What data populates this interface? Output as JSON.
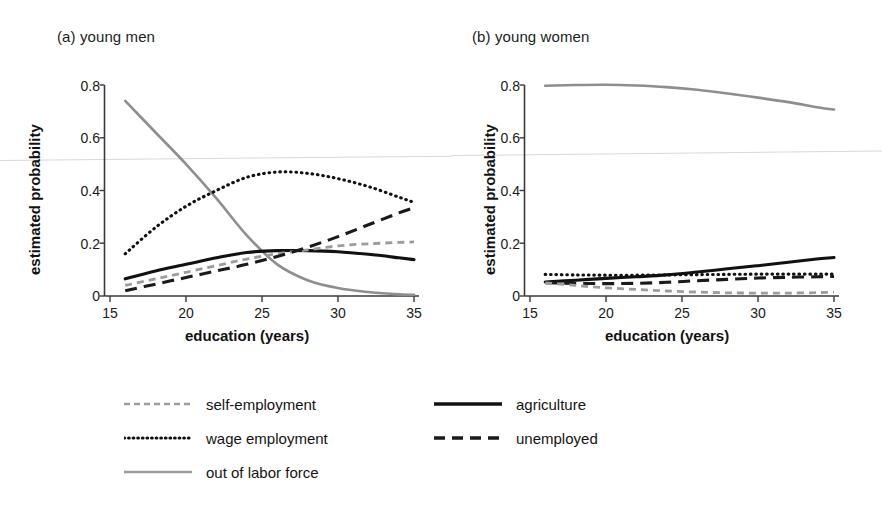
{
  "figure": {
    "background": "#ffffff",
    "panels": [
      {
        "id": "a",
        "title": "(a) young men",
        "xlabel": "education (years)",
        "ylabel": "estimated probability"
      },
      {
        "id": "b",
        "title": "(b) young women",
        "xlabel": "education (years)",
        "ylabel": "estimated probability"
      }
    ]
  },
  "axis": {
    "x_ticks": [
      "15",
      "20",
      "25",
      "30",
      "35"
    ],
    "y_ticks": [
      "0",
      "0.2",
      "0.4",
      "0.6",
      "0.8"
    ]
  },
  "legend": {
    "items": [
      {
        "key": "self",
        "label": "self-employment",
        "style": "gray-short-dash",
        "color": "#9a9a9a"
      },
      {
        "key": "wage",
        "label": "wage employment",
        "style": "black-dotted",
        "color": "#111111"
      },
      {
        "key": "olf",
        "label": "out of labor force",
        "style": "gray-solid",
        "color": "#8e8e8e"
      },
      {
        "key": "agri",
        "label": "agriculture",
        "style": "black-solid",
        "color": "#111111"
      },
      {
        "key": "unemp",
        "label": "unemployed",
        "style": "black-long-dash",
        "color": "#1a1a1a"
      }
    ]
  },
  "chart_data": {
    "type": "line",
    "xlabel": "education (years)",
    "ylabel": "estimated probability",
    "xlim": [
      15,
      35
    ],
    "ylim": [
      0,
      0.8
    ],
    "x_ticks": [
      15,
      20,
      25,
      30,
      35
    ],
    "y_ticks": [
      0,
      0.2,
      0.4,
      0.6,
      0.8
    ],
    "grid": false,
    "legend_position": "below",
    "x": [
      16,
      18,
      20,
      22,
      24,
      26,
      28,
      30,
      32,
      34,
      35
    ],
    "panels": [
      {
        "id": "a",
        "title": "(a) young men",
        "series": [
          {
            "name": "out of labor force",
            "style": "gray-solid",
            "values": [
              0.74,
              0.62,
              0.5,
              0.37,
              0.23,
              0.12,
              0.06,
              0.03,
              0.015,
              0.006,
              0.005
            ]
          },
          {
            "name": "wage employment",
            "style": "black-dotted",
            "values": [
              0.16,
              0.26,
              0.34,
              0.4,
              0.45,
              0.47,
              0.465,
              0.445,
              0.415,
              0.375,
              0.355
            ]
          },
          {
            "name": "agriculture",
            "style": "black-solid",
            "values": [
              0.065,
              0.095,
              0.12,
              0.145,
              0.165,
              0.172,
              0.172,
              0.168,
              0.158,
              0.145,
              0.138
            ]
          },
          {
            "name": "self-employment",
            "style": "gray-short-dash",
            "values": [
              0.04,
              0.065,
              0.09,
              0.115,
              0.14,
              0.16,
              0.175,
              0.19,
              0.198,
              0.203,
              0.205
            ]
          },
          {
            "name": "unemployed",
            "style": "black-long-dash",
            "values": [
              0.02,
              0.045,
              0.07,
              0.095,
              0.12,
              0.15,
              0.185,
              0.225,
              0.27,
              0.315,
              0.335
            ]
          }
        ]
      },
      {
        "id": "b",
        "title": "(b) young women",
        "series": [
          {
            "name": "out of labor force",
            "style": "gray-solid",
            "values": [
              0.797,
              0.8,
              0.801,
              0.798,
              0.792,
              0.782,
              0.768,
              0.752,
              0.735,
              0.715,
              0.707
            ]
          },
          {
            "name": "wage employment",
            "style": "black-dotted",
            "values": [
              0.082,
              0.08,
              0.079,
              0.079,
              0.08,
              0.081,
              0.082,
              0.083,
              0.083,
              0.083,
              0.083
            ]
          },
          {
            "name": "agriculture",
            "style": "black-solid",
            "values": [
              0.053,
              0.06,
              0.067,
              0.073,
              0.08,
              0.091,
              0.103,
              0.115,
              0.128,
              0.141,
              0.146
            ]
          },
          {
            "name": "unemployed",
            "style": "black-long-dash",
            "values": [
              0.05,
              0.048,
              0.047,
              0.048,
              0.052,
              0.058,
              0.063,
              0.068,
              0.071,
              0.073,
              0.074
            ]
          },
          {
            "name": "self-employment",
            "style": "gray-short-dash",
            "values": [
              0.05,
              0.04,
              0.031,
              0.025,
              0.019,
              0.015,
              0.012,
              0.011,
              0.011,
              0.013,
              0.015
            ]
          }
        ]
      }
    ]
  }
}
